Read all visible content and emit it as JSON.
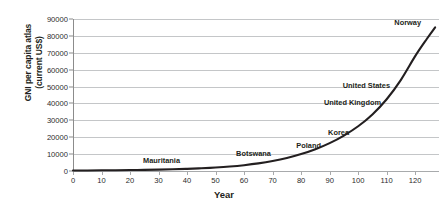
{
  "chart_data": {
    "type": "line",
    "title": "",
    "xlabel": "Year",
    "ylabel": "GNI per capita atlas\n(current US$)",
    "xlim": [
      0,
      128
    ],
    "ylim": [
      0,
      90000
    ],
    "grid": true,
    "legend": "none",
    "xticks": [
      0,
      10,
      20,
      30,
      40,
      50,
      60,
      70,
      80,
      90,
      100,
      110,
      120
    ],
    "yticks": [
      0,
      10000,
      20000,
      30000,
      40000,
      50000,
      60000,
      70000,
      80000,
      90000
    ],
    "series": [
      {
        "name": "GNI per capita atlas (current US$)",
        "color": "#231f20",
        "x": [
          0,
          5,
          10,
          15,
          20,
          25,
          30,
          35,
          40,
          45,
          50,
          55,
          60,
          65,
          70,
          75,
          80,
          85,
          90,
          95,
          100,
          105,
          110,
          115,
          120,
          124,
          127
        ],
        "y": [
          300,
          340,
          400,
          470,
          560,
          680,
          830,
          1020,
          1270,
          1600,
          2050,
          2650,
          3450,
          4500,
          5900,
          7700,
          10000,
          12900,
          16500,
          21000,
          26500,
          33500,
          42500,
          54000,
          68000,
          78000,
          85000
        ]
      }
    ],
    "annotations": [
      {
        "label": "Mauritania",
        "x_px": 180,
        "y_px": 160,
        "value_x": 30,
        "value_y": 830
      },
      {
        "label": "Botswana",
        "x_px": 271,
        "y_px": 153,
        "value_x": 61,
        "value_y": 3600
      },
      {
        "label": "Poland",
        "x_px": 321,
        "y_px": 145,
        "value_x": 80,
        "value_y": 10000
      },
      {
        "label": "Korea",
        "x_px": 349,
        "y_px": 132,
        "value_x": 90,
        "value_y": 17500
      },
      {
        "label": "United Kingdom",
        "x_px": 381,
        "y_px": 102,
        "value_x": 100,
        "value_y": 37000
      },
      {
        "label": "United States",
        "x_px": 390,
        "y_px": 85,
        "value_x": 104,
        "value_y": 47000
      },
      {
        "label": "Norway",
        "x_px": 421,
        "y_px": 22,
        "value_x": 125,
        "value_y": 82000
      }
    ]
  }
}
